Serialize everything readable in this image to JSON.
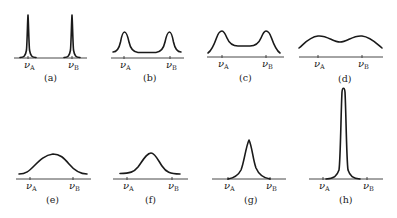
{
  "figure": {
    "panels": [
      {
        "id": "a",
        "caption": "(a)",
        "label_a": "ν",
        "sub_a": "A",
        "label_b": "ν",
        "sub_b": "B",
        "shape": "two sharp peaks at νA and νB"
      },
      {
        "id": "b",
        "caption": "(b)",
        "label_a": "ν",
        "sub_a": "A",
        "label_b": "ν",
        "sub_b": "B",
        "shape": "two broadened peaks"
      },
      {
        "id": "c",
        "caption": "(c)",
        "label_a": "ν",
        "sub_a": "A",
        "label_b": "ν",
        "sub_b": "B",
        "shape": "two broad peaks with raised middle"
      },
      {
        "id": "d",
        "caption": "(d)",
        "label_a": "ν",
        "sub_a": "A",
        "label_b": "ν",
        "sub_b": "B",
        "shape": "broad nearly flat double hump"
      },
      {
        "id": "e",
        "caption": "(e)",
        "label_a": "ν",
        "sub_a": "A",
        "label_b": "ν",
        "sub_b": "B",
        "shape": "single broad coalesced peak"
      },
      {
        "id": "f",
        "caption": "(f)",
        "label_a": "ν",
        "sub_a": "A",
        "label_b": "ν",
        "sub_b": "B",
        "shape": "single narrower peak"
      },
      {
        "id": "g",
        "caption": "(g)",
        "label_a": "ν",
        "sub_a": "A",
        "label_b": "ν",
        "sub_b": "B",
        "shape": "single sharper peak"
      },
      {
        "id": "h",
        "caption": "(h)",
        "label_a": "ν",
        "sub_a": "A",
        "label_b": "ν",
        "sub_b": "B",
        "shape": "single very sharp tall peak"
      }
    ]
  }
}
